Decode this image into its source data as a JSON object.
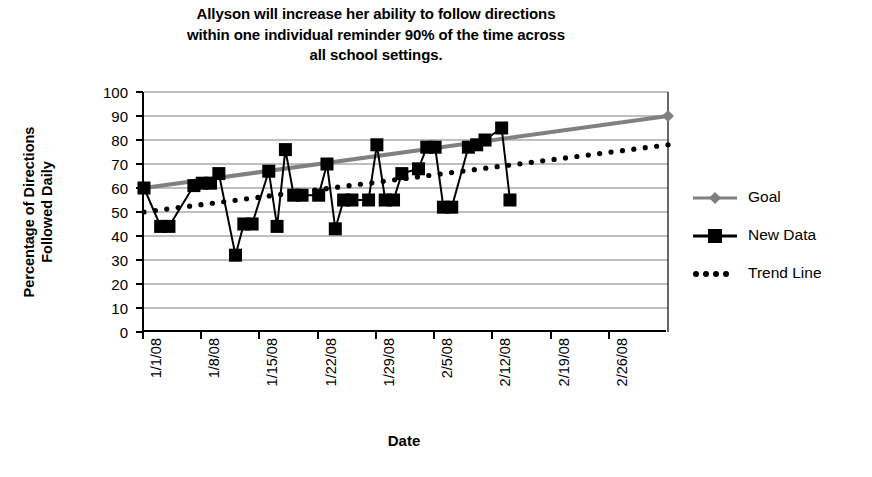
{
  "chart_data": {
    "type": "line",
    "title_lines": [
      "Allyson will increase her ability to follow directions",
      "within one individual reminder 90% of the time across",
      "all school settings."
    ],
    "xlabel": "Date",
    "ylabel": "Percentage of Directions Followed Daily",
    "ylabel_lines": [
      "Percentage of Directions",
      "Followed Daily"
    ],
    "ylim": [
      0,
      100
    ],
    "ytick_labels": [
      "100",
      "90",
      "80",
      "70",
      "60",
      "50",
      "40",
      "30",
      "20",
      "10",
      "0"
    ],
    "ytick_values": [
      100,
      90,
      80,
      70,
      60,
      50,
      40,
      30,
      20,
      10,
      0
    ],
    "xtick_labels": [
      "1/1/08",
      "1/8/08",
      "1/15/08",
      "1/22/08",
      "1/29/08",
      "2/5/08",
      "2/12/08",
      "2/19/08",
      "2/26/08"
    ],
    "xtick_days": [
      0,
      7,
      14,
      21,
      28,
      35,
      42,
      49,
      56
    ],
    "x_range_days": [
      0,
      63
    ],
    "grid": "horizontal",
    "legend_position": "right",
    "colors": {
      "goal": "#808080",
      "new_data": "#000000",
      "trend_line": "#000000",
      "gridline": "#808080",
      "axis": "#000000",
      "background": "#ffffff"
    },
    "series": [
      {
        "name": "Goal",
        "marker": "diamond",
        "style": "solid",
        "color": "#808080",
        "x": [
          0,
          63
        ],
        "values": [
          60,
          90
        ]
      },
      {
        "name": "Trend Line",
        "marker": "dotted",
        "style": "dotted",
        "color": "#000000",
        "x": [
          0,
          63
        ],
        "values": [
          50,
          78
        ]
      },
      {
        "name": "New Data",
        "marker": "square",
        "style": "solid",
        "color": "#000000",
        "x": [
          0,
          2,
          3,
          6,
          7,
          8,
          9,
          11,
          12,
          13,
          15,
          16,
          17,
          18,
          19,
          21,
          22,
          23,
          24,
          25,
          27,
          28,
          29,
          30,
          31,
          33,
          34,
          35,
          36,
          37,
          39,
          40,
          41,
          43,
          44
        ],
        "values": [
          60,
          44,
          44,
          61,
          62,
          62,
          66,
          32,
          45,
          45,
          67,
          44,
          76,
          57,
          57,
          57,
          70,
          43,
          55,
          55,
          55,
          78,
          55,
          55,
          66,
          68,
          77,
          77,
          52,
          52,
          77,
          78,
          80,
          85,
          55
        ]
      }
    ],
    "annotations": []
  },
  "legend": {
    "items": [
      {
        "label": "Goal",
        "key": "goal-line-diamond"
      },
      {
        "label": "New Data",
        "key": "new-data-line-square"
      },
      {
        "label": "Trend Line",
        "key": "trend-line-dotted"
      }
    ]
  }
}
